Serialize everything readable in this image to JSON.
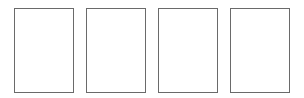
{
  "pages": [
    {
      "index": 1
    },
    {
      "index": 2
    },
    {
      "index": 3
    },
    {
      "index": 4
    }
  ],
  "colors": {
    "border": "#6a6a6a",
    "background": "#ffffff"
  }
}
